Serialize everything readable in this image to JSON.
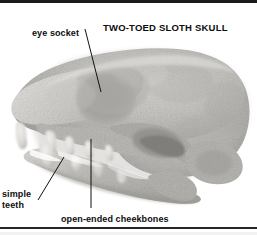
{
  "figure": {
    "title": "TWO-TOED SLOTH SKULL",
    "image_type": "grayscale photograph",
    "background_color": "#ffffff",
    "text_color": "#0d0d0d",
    "border_color": "#1a1a1a"
  },
  "annotations": {
    "eye_socket": {
      "label": "eye socket",
      "line": {
        "x1": 85,
        "y1": 29,
        "x2": 101,
        "y2": 92
      }
    },
    "simple_teeth": {
      "label_line1": "simple",
      "label_line2": "teeth",
      "line": {
        "x1": 38,
        "y1": 200,
        "x2": 64,
        "y2": 157
      }
    },
    "open_ended_cheekbones": {
      "label": "open-ended cheekbones",
      "line": {
        "x1": 91,
        "y1": 139,
        "x2": 91,
        "y2": 208
      }
    }
  },
  "divider": {
    "present": "true",
    "color": "#262626"
  }
}
